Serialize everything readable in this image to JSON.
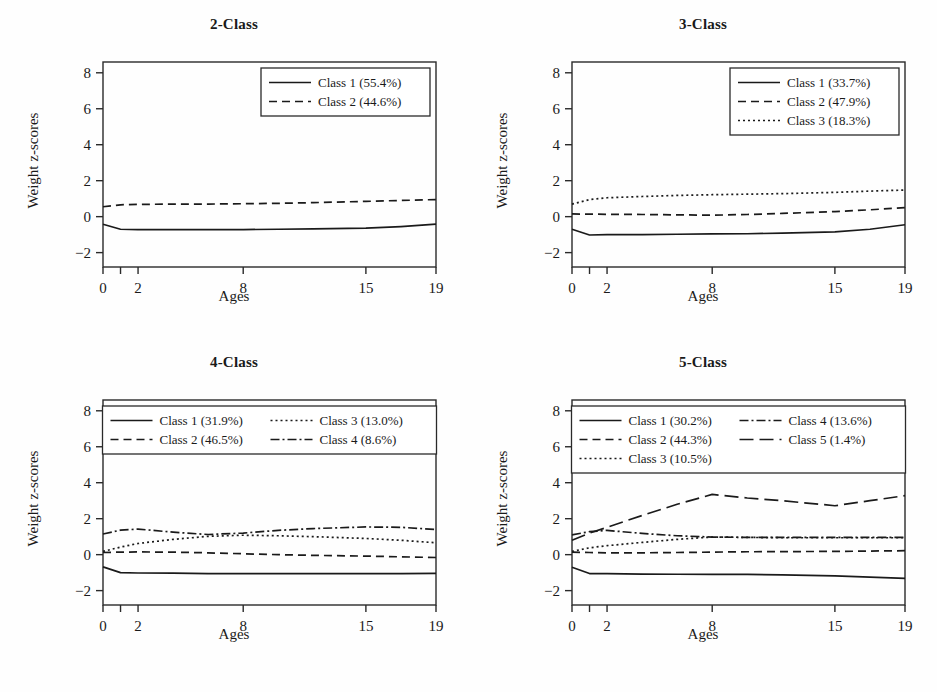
{
  "figure": {
    "width": 937,
    "height": 692,
    "background": "#fefefe",
    "line_color": "#1a1a1a",
    "axis_color": "#2a2a2a"
  },
  "chart_data": [
    {
      "type": "line",
      "title": "2-Class",
      "xlabel": "Ages",
      "ylabel": "Weight z-scores",
      "xlim": [
        0,
        19
      ],
      "ylim": [
        -2.8,
        8.6
      ],
      "yticks": [
        -2,
        0,
        2,
        4,
        6,
        8
      ],
      "ytick_labels": [
        "−2",
        "0",
        "2",
        "4",
        "6",
        "8"
      ],
      "xticks": [
        0,
        1,
        2,
        8,
        15,
        19
      ],
      "xtick_labels": [
        "0",
        "",
        "2",
        "8",
        "15",
        "19"
      ],
      "grid": false,
      "legend_position": "top-right",
      "x": [
        0,
        1,
        2,
        4,
        6,
        8,
        10,
        12,
        15,
        17,
        19
      ],
      "series": [
        {
          "name": "Class 1 (55.4%)",
          "dash": "solid",
          "values": [
            -0.42,
            -0.7,
            -0.72,
            -0.72,
            -0.72,
            -0.72,
            -0.7,
            -0.68,
            -0.64,
            -0.55,
            -0.42
          ]
        },
        {
          "name": "Class 2 (44.6%)",
          "dash": "dashed",
          "values": [
            0.55,
            0.66,
            0.68,
            0.7,
            0.7,
            0.72,
            0.74,
            0.78,
            0.85,
            0.9,
            0.95
          ]
        }
      ]
    },
    {
      "type": "line",
      "title": "3-Class",
      "xlabel": "Ages",
      "ylabel": "Weight z-scores",
      "xlim": [
        0,
        19
      ],
      "ylim": [
        -2.8,
        8.6
      ],
      "yticks": [
        -2,
        0,
        2,
        4,
        6,
        8
      ],
      "ytick_labels": [
        "−2",
        "0",
        "2",
        "4",
        "6",
        "8"
      ],
      "xticks": [
        0,
        1,
        2,
        8,
        15,
        19
      ],
      "xtick_labels": [
        "0",
        "",
        "2",
        "8",
        "15",
        "19"
      ],
      "grid": false,
      "legend_position": "top-right",
      "x": [
        0,
        1,
        2,
        4,
        6,
        8,
        10,
        12,
        15,
        17,
        19
      ],
      "series": [
        {
          "name": "Class 1 (33.7%)",
          "dash": "solid",
          "values": [
            -0.7,
            -1.02,
            -1.0,
            -1.0,
            -0.98,
            -0.96,
            -0.95,
            -0.92,
            -0.85,
            -0.7,
            -0.45
          ]
        },
        {
          "name": "Class 2 (47.9%)",
          "dash": "dashed",
          "values": [
            0.15,
            0.14,
            0.13,
            0.12,
            0.1,
            0.08,
            0.12,
            0.18,
            0.28,
            0.38,
            0.5
          ]
        },
        {
          "name": "Class 3 (18.3%)",
          "dash": "dotted",
          "values": [
            0.7,
            0.95,
            1.05,
            1.12,
            1.18,
            1.22,
            1.25,
            1.28,
            1.35,
            1.42,
            1.48
          ]
        }
      ]
    },
    {
      "type": "line",
      "title": "4-Class",
      "xlabel": "Ages",
      "ylabel": "Weight z-scores",
      "xlim": [
        0,
        19
      ],
      "ylim": [
        -2.8,
        8.6
      ],
      "yticks": [
        -2,
        0,
        2,
        4,
        6,
        8
      ],
      "ytick_labels": [
        "−2",
        "0",
        "2",
        "4",
        "6",
        "8"
      ],
      "xticks": [
        0,
        1,
        2,
        8,
        15,
        19
      ],
      "xtick_labels": [
        "0",
        "",
        "2",
        "8",
        "15",
        "19"
      ],
      "grid": false,
      "legend_position": "top-inside",
      "x": [
        0,
        1,
        2,
        4,
        6,
        8,
        10,
        12,
        15,
        17,
        19
      ],
      "series": [
        {
          "name": "Class 1 (31.9%)",
          "dash": "solid",
          "values": [
            -0.68,
            -1.0,
            -1.02,
            -1.03,
            -1.05,
            -1.06,
            -1.06,
            -1.06,
            -1.05,
            -1.05,
            -1.04
          ]
        },
        {
          "name": "Class 2 (46.5%)",
          "dash": "dashed",
          "values": [
            0.12,
            0.14,
            0.15,
            0.14,
            0.1,
            0.05,
            0.0,
            -0.04,
            -0.08,
            -0.12,
            -0.16
          ]
        },
        {
          "name": "Class 3 (13.0%)",
          "dash": "dotted",
          "values": [
            0.18,
            0.42,
            0.62,
            0.85,
            1.02,
            1.08,
            1.05,
            1.0,
            0.9,
            0.8,
            0.66
          ]
        },
        {
          "name": "Class 4 (8.6%)",
          "dash": "dashdot",
          "values": [
            1.15,
            1.36,
            1.42,
            1.25,
            1.12,
            1.2,
            1.35,
            1.45,
            1.54,
            1.52,
            1.4
          ]
        }
      ]
    },
    {
      "type": "line",
      "title": "5-Class",
      "xlabel": "Ages",
      "ylabel": "Weight z-scores",
      "xlim": [
        0,
        19
      ],
      "ylim": [
        -2.8,
        8.6
      ],
      "yticks": [
        -2,
        0,
        2,
        4,
        6,
        8
      ],
      "ytick_labels": [
        "−2",
        "0",
        "2",
        "4",
        "6",
        "8"
      ],
      "xticks": [
        0,
        1,
        2,
        8,
        15,
        19
      ],
      "xtick_labels": [
        "0",
        "",
        "2",
        "8",
        "15",
        "19"
      ],
      "grid": false,
      "legend_position": "top-inside",
      "x": [
        0,
        1,
        2,
        4,
        6,
        8,
        10,
        12,
        15,
        17,
        19
      ],
      "series": [
        {
          "name": "Class 1 (30.2%)",
          "dash": "solid",
          "values": [
            -0.7,
            -1.05,
            -1.06,
            -1.08,
            -1.09,
            -1.1,
            -1.1,
            -1.12,
            -1.18,
            -1.25,
            -1.32
          ]
        },
        {
          "name": "Class 2 (44.3%)",
          "dash": "dashed",
          "values": [
            0.14,
            0.12,
            0.1,
            0.1,
            0.12,
            0.14,
            0.16,
            0.17,
            0.18,
            0.2,
            0.22
          ]
        },
        {
          "name": "Class 3 (10.5%)",
          "dash": "dotted",
          "values": [
            0.18,
            0.38,
            0.5,
            0.68,
            0.85,
            0.98,
            0.96,
            0.94,
            0.94,
            0.94,
            0.94
          ]
        },
        {
          "name": "Class 4 (13.6%)",
          "dash": "dashdot",
          "values": [
            1.1,
            1.28,
            1.35,
            1.18,
            1.05,
            0.98,
            0.96,
            0.96,
            0.96,
            0.96,
            0.96
          ]
        },
        {
          "name": "Class 5 (1.4%)",
          "dash": "longdash",
          "values": [
            0.8,
            1.2,
            1.52,
            2.18,
            2.8,
            3.35,
            3.15,
            3.0,
            2.72,
            3.0,
            3.28
          ]
        }
      ]
    }
  ]
}
